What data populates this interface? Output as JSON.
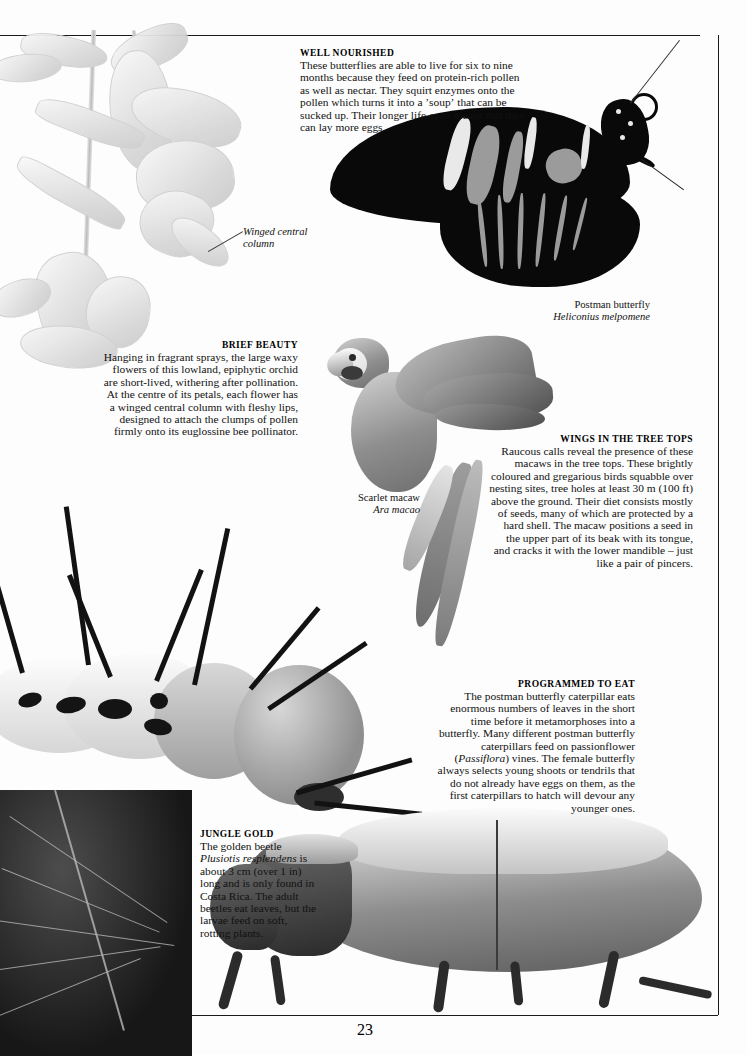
{
  "page": {
    "folio": "23",
    "ink_color": "#111111",
    "paper_color": "#fdfdfd"
  },
  "blocks": [
    {
      "id": "well-nourished",
      "heading": "WELL NOURISHED",
      "body": "These butterflies are able to live for six to nine months because they feed on protein-rich pollen as well as nectar. They squirt enzymes onto the pollen which turns it into a ʼsoupʼ that can be sucked up. Their longer life-span means that they can lay more eggs.",
      "align": "left"
    },
    {
      "id": "brief-beauty",
      "heading": "BRIEF BEAUTY",
      "body": "Hanging in fragrant sprays, the large waxy flowers of this lowland, epiphytic orchid are short-lived, withering after pollination. At the centre of its petals, each flower has a winged central column with fleshy lips, designed to attach the clumps of pollen firmly onto its euglossine bee pollinator.",
      "align": "right"
    },
    {
      "id": "wings-in-the-tree-tops",
      "heading": "WINGS IN THE TREE TOPS",
      "body": "Raucous calls reveal the presence of these macaws in the tree tops. These brightly coloured and gregarious birds squabble over nesting sites, tree holes at least 30 m (100 ft) above the ground. Their diet consists mostly of seeds, many of which are protected by a hard shell. The macaw positions a seed in the upper part of its beak with its tongue, and cracks it with the lower mandible – just like a pair of pincers.",
      "align": "right"
    },
    {
      "id": "programmed-to-eat",
      "heading": "PROGRAMMED TO EAT",
      "body_part_1": "The postman butterfly caterpillar eats enormous numbers of leaves in the short time before it metamorphoses into a butterfly. Many different postman butterfly caterpillars feed on passionflower (",
      "body_italic": "Passiflora",
      "body_part_2": ") vines. The female butterfly always selects young shoots or tendrils that do not already have eggs on them, as the first caterpillars to hatch will devour any younger ones.",
      "align": "right"
    },
    {
      "id": "jungle-gold",
      "heading": "JUNGLE GOLD",
      "body_part_1": "The golden beetle ",
      "body_italic": "Plusiotis resplendens",
      "body_part_2": " is about 3 cm (over 1 in) long and is only found in Costa Rica. The adult beetles eat leaves, but the larvae feed on soft, rotting plants.",
      "align": "left"
    }
  ],
  "captions": [
    {
      "id": "winged-central-column",
      "common": "Winged central",
      "second_line": "column",
      "style": "italic"
    },
    {
      "id": "postman-butterfly",
      "common": "Postman butterfly",
      "scientific": "Heliconius melpomene"
    },
    {
      "id": "scarlet-macaw",
      "common": "Scarlet macaw",
      "scientific": "Ara macao"
    }
  ]
}
